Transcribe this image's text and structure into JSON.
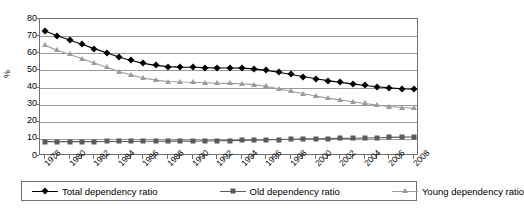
{
  "chart_data": {
    "type": "line",
    "title": "",
    "xlabel": "",
    "ylabel": "%",
    "ylim": [
      0,
      80
    ],
    "ytick_step": 10,
    "yticks": [
      "0",
      "10",
      "20",
      "30",
      "40",
      "50",
      "60",
      "70",
      "80"
    ],
    "grid": true,
    "legend_position": "bottom",
    "x": [
      1978,
      1979,
      1980,
      1981,
      1982,
      1983,
      1984,
      1985,
      1986,
      1987,
      1988,
      1989,
      1990,
      1991,
      1992,
      1993,
      1994,
      1995,
      1996,
      1997,
      1998,
      1999,
      2000,
      2001,
      2002,
      2003,
      2004,
      2005,
      2006,
      2007,
      2008
    ],
    "xtick_labels": [
      "1978",
      "1980",
      "1982",
      "1984",
      "1986",
      "1988",
      "1990",
      "1992",
      "1994",
      "1996",
      "1998",
      "2000",
      "2002",
      "2004",
      "2006",
      "2008"
    ],
    "series": [
      {
        "name": "Total dependency ratio",
        "marker": "diamond",
        "color": "#000000",
        "values": [
          73.0,
          70.2,
          67.7,
          65.2,
          62.7,
          60.3,
          57.8,
          55.8,
          54.1,
          52.9,
          52.2,
          51.9,
          51.8,
          51.6,
          51.4,
          51.4,
          51.3,
          50.9,
          50.0,
          48.9,
          47.6,
          46.4,
          45.1,
          44.0,
          43.0,
          42.1,
          41.2,
          40.4,
          39.8,
          39.3,
          39.0
        ]
      },
      {
        "name": "Old dependency ratio",
        "marker": "square",
        "color": "#5a5a5a",
        "values": [
          8.4,
          8.4,
          8.4,
          8.4,
          8.4,
          8.5,
          8.5,
          8.5,
          8.6,
          8.6,
          8.7,
          8.7,
          8.7,
          8.8,
          8.9,
          9.0,
          9.1,
          9.2,
          9.4,
          9.6,
          9.8,
          10.0,
          10.1,
          10.2,
          10.3,
          10.4,
          10.5,
          10.7,
          10.9,
          11.0,
          11.1
        ]
      },
      {
        "name": "Young dependency ratio",
        "marker": "triangle",
        "color": "#9b9b9b",
        "values": [
          64.6,
          61.8,
          59.3,
          56.8,
          54.3,
          51.8,
          49.3,
          47.3,
          45.5,
          44.3,
          43.5,
          43.2,
          43.1,
          42.8,
          42.5,
          42.4,
          42.2,
          41.7,
          40.6,
          39.3,
          37.8,
          36.4,
          35.0,
          33.8,
          32.7,
          31.7,
          30.7,
          29.7,
          28.9,
          28.3,
          27.9
        ]
      }
    ]
  },
  "axes": {
    "y_title": "%"
  }
}
